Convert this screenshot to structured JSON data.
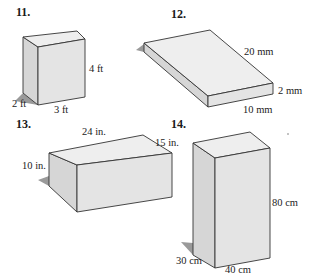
{
  "figures": [
    {
      "number": "11.",
      "shape": "rectangular prism",
      "labels": {
        "height": "4 ft",
        "depth": "2 ft",
        "width": "3 ft"
      }
    },
    {
      "number": "12.",
      "shape": "rectangular prism",
      "labels": {
        "length": "20 mm",
        "height": "2 mm",
        "width": "10 mm"
      }
    },
    {
      "number": "13.",
      "shape": "rectangular prism",
      "labels": {
        "length": "24 in.",
        "depth": "15 in.",
        "height": "10 in."
      }
    },
    {
      "number": "14.",
      "shape": "rectangular prism",
      "labels": {
        "height": "80 cm",
        "depth": "30 cm",
        "width": "40 cm"
      }
    }
  ],
  "colors": {
    "top_face": "#ececec",
    "front_face": "#e2e2e2",
    "side_face": "#d4d4d4",
    "shadow": "#9a9a9a",
    "edge": "#333333"
  }
}
